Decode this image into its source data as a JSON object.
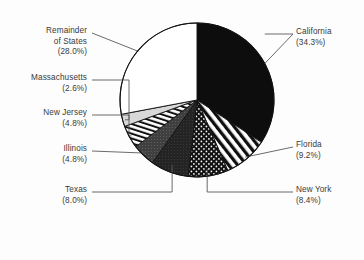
{
  "chart_data": {
    "type": "pie",
    "title": "",
    "subtitle": "",
    "xlabel": "",
    "ylabel": "",
    "legend_position": "none",
    "grid": false,
    "units": "percent",
    "start_angle_deg": 0,
    "direction": "clockwise",
    "categories": [
      "California",
      "Florida",
      "New York",
      "Texas",
      "Illinois",
      "New Jersey",
      "Massachusetts",
      "Remainder of States"
    ],
    "values": [
      34.3,
      9.2,
      8.4,
      8.0,
      4.8,
      4.8,
      2.6,
      28.0
    ],
    "slices": [
      {
        "name": "California",
        "label_name": "California",
        "value": 34.3,
        "percent_text": "(34.3%)",
        "pattern": "solid-black",
        "fill": "#0d0d0d",
        "label_side": "right",
        "label_x": 296,
        "label_y": 27
      },
      {
        "name": "Florida",
        "label_name": "Florida",
        "value": 9.2,
        "percent_text": "(9.2%)",
        "pattern": "diagonal-stripes",
        "fill": "#ffffff",
        "label_side": "right",
        "label_x": 296,
        "label_y": 140
      },
      {
        "name": "New York",
        "label_name": "New York",
        "value": 8.4,
        "percent_text": "(8.4%)",
        "pattern": "dotted-stipple",
        "fill": "#1a1a1a",
        "label_side": "right",
        "label_x": 296,
        "label_y": 185
      },
      {
        "name": "Texas",
        "label_name": "Texas",
        "value": 8.0,
        "percent_text": "(8.0%)",
        "pattern": "dark-solid",
        "fill": "#202020",
        "label_side": "left",
        "label_x": 87,
        "label_y": 185
      },
      {
        "name": "Illinois",
        "label_name": "Illinois",
        "value": 4.8,
        "percent_text": "(4.8%)",
        "pattern": "medium-gray",
        "fill": "#3d3d3d",
        "label_side": "left",
        "label_x": 87,
        "label_y": 144
      },
      {
        "name": "New Jersey",
        "label_name": "New Jersey",
        "value": 4.8,
        "percent_text": "(4.8%)",
        "pattern": "vertical-stripes",
        "fill": "#ffffff",
        "label_side": "left",
        "label_x": 87,
        "label_y": 108
      },
      {
        "name": "Massachusetts",
        "label_name": "Massachusetts",
        "value": 2.6,
        "percent_text": "(2.6%)",
        "pattern": "light-gray",
        "fill": "#d2d2d2",
        "label_side": "left",
        "label_x": 87,
        "label_y": 73
      },
      {
        "name": "Remainder of States",
        "label_name": "Remainder\nof States",
        "label_name_line1": "Remainder",
        "label_name_line2": "of States",
        "value": 28.0,
        "percent_text": "(28.0%)",
        "pattern": "white",
        "fill": "#ffffff",
        "label_side": "left",
        "label_x": 87,
        "label_y": 26
      }
    ],
    "geometry": {
      "center_x": 197,
      "center_y": 100,
      "radius": 77
    },
    "colors": {
      "outline": "#111111",
      "leader_line": "#5a5a5a",
      "text": "#3a3a3a",
      "background": "#ffffff"
    }
  }
}
